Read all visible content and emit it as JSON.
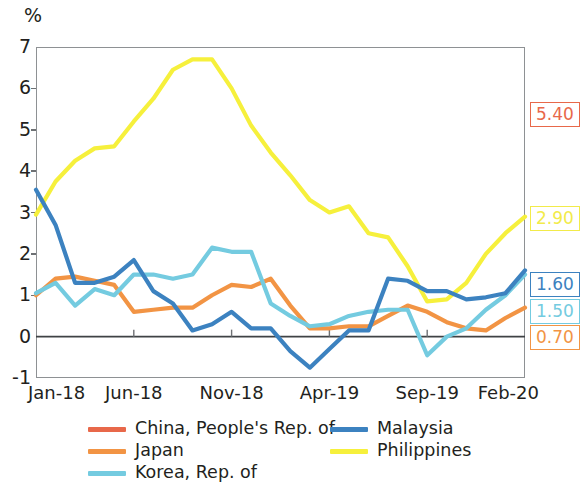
{
  "chart_data": {
    "type": "line",
    "title": "",
    "subtitle": "",
    "xlabel": "",
    "ylabel": "%",
    "unit_label": "%",
    "ylim": [
      -1,
      7
    ],
    "ytick_values": [
      -1,
      0,
      1,
      2,
      3,
      4,
      5,
      6,
      7
    ],
    "ytick_labels": [
      "-1",
      "0",
      "1",
      "2",
      "3",
      "4",
      "5",
      "6",
      "7"
    ],
    "grid": false,
    "legend_position": "bottom",
    "zero_line": true,
    "x": [
      "Jan-18",
      "Feb-18",
      "Mar-18",
      "Apr-18",
      "May-18",
      "Jun-18",
      "Jul-18",
      "Aug-18",
      "Sep-18",
      "Oct-18",
      "Nov-18",
      "Dec-18",
      "Jan-19",
      "Feb-19",
      "Mar-19",
      "Apr-19",
      "May-19",
      "Jun-19",
      "Jul-19",
      "Aug-19",
      "Sep-19",
      "Oct-19",
      "Nov-19",
      "Dec-19",
      "Jan-20",
      "Feb-20"
    ],
    "xtick_labels": [
      "Jan-18",
      "Jun-18",
      "Nov-18",
      "Apr-19",
      "Sep-19",
      "Feb-20"
    ],
    "xtick_indices": [
      0,
      5,
      10,
      15,
      20,
      25
    ],
    "series": [
      {
        "name": "China, People's Rep. of",
        "color": "#E8684A",
        "values": [
          1.8,
          1.5,
          2.95,
          2.3,
          1.95,
          1.85,
          1.9,
          2.1,
          2.3,
          2.45,
          2.45,
          2.2,
          1.8,
          1.5,
          2.25,
          2.5,
          2.6,
          2.7,
          2.75,
          2.8,
          3.0,
          3.8,
          4.5,
          4.5,
          5.0,
          5.4
        ],
        "end_value": "5.40"
      },
      {
        "name": "Japan",
        "color": "#F29444",
        "values": [
          1.0,
          1.4,
          1.45,
          1.35,
          1.25,
          0.6,
          0.65,
          0.7,
          0.7,
          1.0,
          1.25,
          1.2,
          1.4,
          0.75,
          0.2,
          0.2,
          0.25,
          0.25,
          0.5,
          0.75,
          0.6,
          0.35,
          0.2,
          0.15,
          0.45,
          0.7
        ],
        "end_value": "0.70"
      },
      {
        "name": "Korea, Rep. of",
        "color": "#74CBE0",
        "values": [
          1.05,
          1.3,
          0.75,
          1.15,
          1.0,
          1.5,
          1.5,
          1.4,
          1.5,
          2.15,
          2.05,
          2.05,
          0.8,
          0.5,
          0.25,
          0.3,
          0.5,
          0.6,
          0.65,
          0.65,
          -0.45,
          0.0,
          0.2,
          0.65,
          1.0,
          1.5
        ],
        "end_value": "1.50"
      },
      {
        "name": "Malaysia",
        "color": "#3C82C0",
        "values": [
          3.55,
          2.7,
          1.3,
          1.3,
          1.45,
          1.85,
          1.1,
          0.8,
          0.15,
          0.3,
          0.6,
          0.2,
          0.2,
          -0.35,
          -0.75,
          -0.3,
          0.15,
          0.15,
          1.4,
          1.35,
          1.1,
          1.1,
          0.9,
          0.95,
          1.05,
          1.6
        ],
        "end_value": "1.60"
      },
      {
        "name": "Philippines",
        "color": "#F6F03C",
        "values": [
          2.95,
          3.75,
          4.25,
          4.55,
          4.6,
          5.2,
          5.75,
          6.45,
          6.7,
          6.7,
          6.0,
          5.1,
          4.45,
          3.9,
          3.3,
          3.0,
          3.15,
          2.5,
          2.4,
          1.7,
          0.85,
          0.9,
          1.3,
          2.0,
          2.5,
          2.9
        ],
        "end_value": "2.90"
      }
    ]
  },
  "end_labels": [
    {
      "value": "5.40",
      "color": "#E8684A"
    },
    {
      "value": "2.90",
      "color": "#F2EB4A"
    },
    {
      "value": "1.60",
      "color": "#3C82C0"
    },
    {
      "value": "1.50",
      "color": "#74CBE0"
    },
    {
      "value": "0.70",
      "color": "#F29444"
    }
  ],
  "legend": {
    "left_column": [
      {
        "label": "China, People's Rep. of",
        "color": "#E8684A"
      },
      {
        "label": "Japan",
        "color": "#F29444"
      },
      {
        "label": "Korea, Rep. of",
        "color": "#74CBE0"
      }
    ],
    "right_column": [
      {
        "label": "Malaysia",
        "color": "#3C82C0"
      },
      {
        "label": "Philippines",
        "color": "#F6F03C"
      }
    ]
  }
}
